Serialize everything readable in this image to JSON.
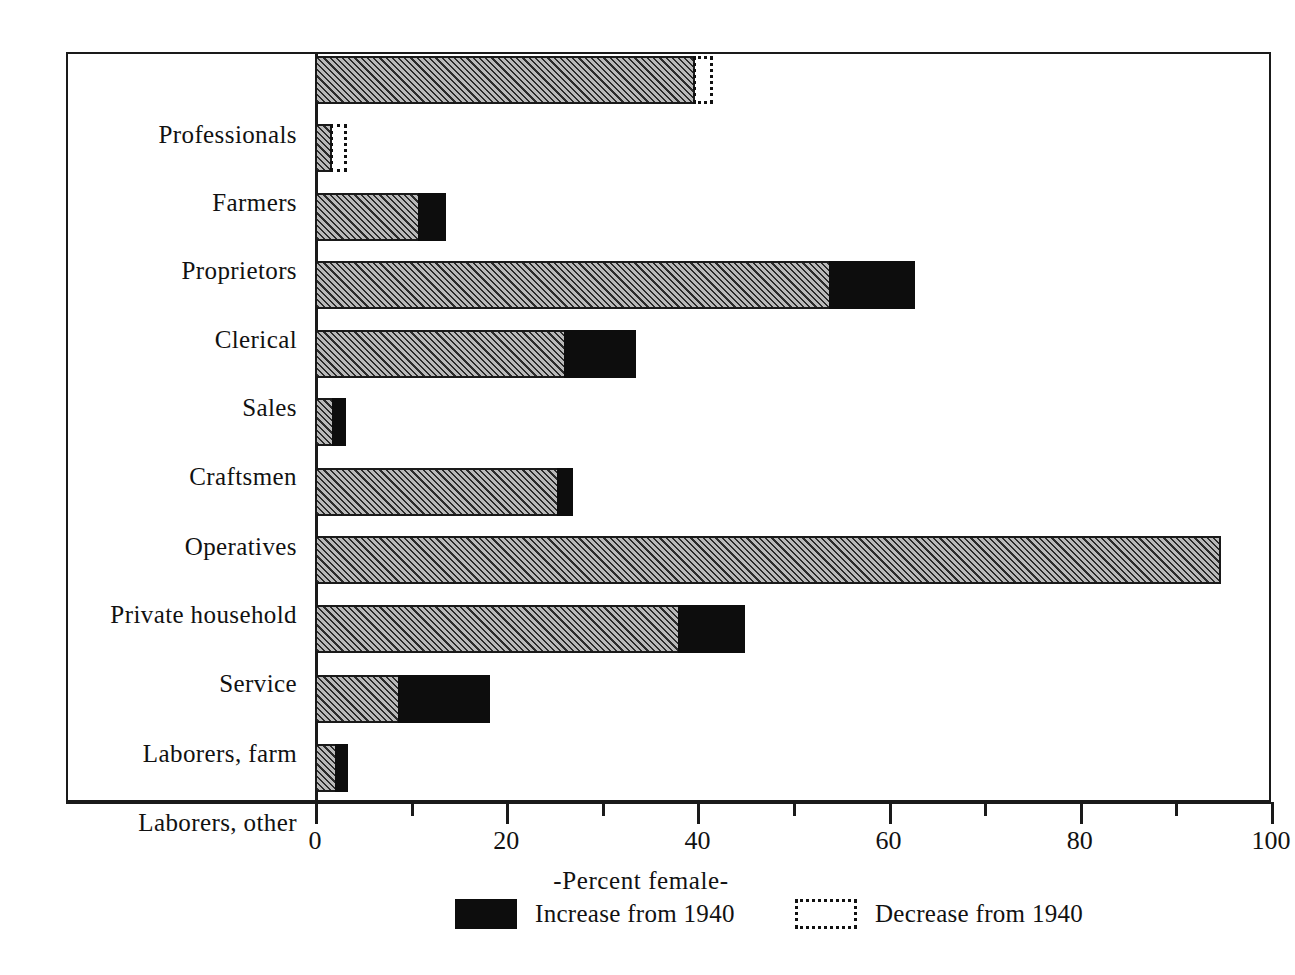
{
  "chart_data": {
    "type": "bar",
    "orientation": "horizontal",
    "stacked": true,
    "title": "",
    "xlabel": "-Percent female-",
    "ylabel": "",
    "xlim": [
      0,
      100
    ],
    "grid": false,
    "major_ticks": [
      0,
      20,
      40,
      60,
      80,
      100
    ],
    "minor_ticks": [
      10,
      30,
      50,
      70,
      90
    ],
    "tick_labels": [
      "0",
      "20",
      "40",
      "60",
      "80",
      "100"
    ],
    "legend_position": "bottom",
    "categories": [
      "Professionals",
      "Farmers",
      "Proprietors",
      "Clerical",
      "Sales",
      "Craftsmen",
      "Operatives",
      "Private household",
      "Service",
      "Laborers, farm",
      "Laborers, other"
    ],
    "series": [
      {
        "name": "1940 level",
        "key": "base",
        "values": [
          39.8,
          1.8,
          11.0,
          54.0,
          26.3,
          2.0,
          25.5,
          94.8,
          38.2,
          8.9,
          2.3
        ]
      },
      {
        "name": "Increase from 1940",
        "key": "increase",
        "values": [
          0,
          0,
          2.7,
          8.8,
          7.3,
          1.2,
          1.5,
          0,
          6.8,
          9.4,
          1.2
        ]
      },
      {
        "name": "Decrease from 1940",
        "key": "decrease",
        "values": [
          1.6,
          1.3,
          0,
          0,
          0,
          0,
          0,
          0,
          0,
          0,
          0
        ]
      }
    ],
    "totals": [
      41.4,
      3.1,
      13.7,
      62.8,
      33.6,
      3.2,
      27.0,
      94.8,
      45.0,
      18.3,
      3.5
    ],
    "legend": [
      {
        "label": "Increase from 1940",
        "swatch": "solid-black"
      },
      {
        "label": "Decrease from 1940",
        "swatch": "dotted-outline"
      }
    ],
    "colors": {
      "base_fill": "#b9b9b9",
      "base_hatch": "#2b2b2b",
      "increase": "#0d0d0d",
      "outline": "#1a1a1a",
      "background": "#ffffff"
    }
  }
}
